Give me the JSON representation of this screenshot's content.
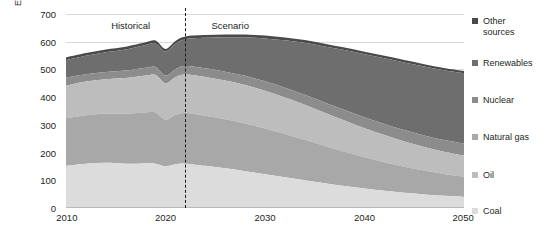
{
  "chart_data": {
    "type": "area",
    "stacked": true,
    "title": "",
    "subtitle": "",
    "xlabel": "",
    "ylabel": "EJ",
    "unit": "EJ",
    "grid": true,
    "legend_position": "right",
    "xlim": [
      2010,
      2050
    ],
    "ylim": [
      0,
      700
    ],
    "ytick_labels": [
      "0",
      "100",
      "200",
      "300",
      "400",
      "500",
      "600",
      "700"
    ],
    "yticks": [
      0,
      100,
      200,
      300,
      400,
      500,
      600,
      700
    ],
    "xtick_labels": [
      "2010",
      "2020",
      "2030",
      "2040",
      "2050"
    ],
    "xticks": [
      2010,
      2020,
      2030,
      2040,
      2050
    ],
    "x": [
      2010,
      2012,
      2014,
      2016,
      2018,
      2019,
      2020,
      2021,
      2022,
      2024,
      2026,
      2028,
      2030,
      2032,
      2034,
      2036,
      2038,
      2040,
      2042,
      2044,
      2046,
      2048,
      2050
    ],
    "series": [
      {
        "name": "Coal",
        "color": "#dcdcdc",
        "values": [
          152,
          160,
          163,
          160,
          161,
          160,
          151,
          158,
          160,
          152,
          143,
          133,
          122,
          111,
          100,
          89,
          79,
          70,
          62,
          55,
          49,
          44,
          40
        ]
      },
      {
        "name": "Oil",
        "color": "#a8a8a8",
        "values": [
          172,
          175,
          178,
          181,
          184,
          185,
          168,
          178,
          183,
          181,
          177,
          172,
          165,
          156,
          146,
          135,
          124,
          113,
          103,
          94,
          86,
          79,
          73
        ]
      },
      {
        "name": "Natural gas",
        "color": "#bdbdbd",
        "values": [
          117,
          121,
          124,
          128,
          133,
          135,
          131,
          136,
          139,
          140,
          140,
          139,
          136,
          132,
          127,
          120,
          113,
          105,
          98,
          91,
          85,
          80,
          76
        ]
      },
      {
        "name": "Nuclear",
        "color": "#8c8c8c",
        "values": [
          30,
          27,
          26,
          27,
          28,
          29,
          28,
          29,
          30,
          31,
          32,
          33,
          34,
          35,
          36,
          37,
          38,
          39,
          40,
          41,
          42,
          42,
          43
        ]
      },
      {
        "name": "Renewables",
        "color": "#6e6e6e",
        "values": [
          62,
          66,
          71,
          76,
          82,
          85,
          87,
          92,
          97,
          110,
          124,
          139,
          155,
          171,
          187,
          202,
          216,
          228,
          237,
          244,
          249,
          252,
          254
        ]
      },
      {
        "name": "Other sources",
        "color": "#4a4a4a",
        "values": [
          10,
          10,
          10,
          10,
          10,
          10,
          9,
          10,
          10,
          10,
          10,
          10,
          10,
          10,
          10,
          10,
          9,
          9,
          9,
          9,
          8,
          8,
          8
        ]
      }
    ],
    "annotations": [
      {
        "name": "historical",
        "text": "Historical",
        "x": 2016.5,
        "y": 660
      },
      {
        "name": "scenario",
        "text": "Scenario",
        "x": 2026.5,
        "y": 660
      },
      {
        "name": "phase-divider",
        "text": "",
        "x": 2022,
        "type": "dashed-vline"
      }
    ]
  },
  "legend": {
    "items": [
      {
        "label": "Other\nsources",
        "color": "#4a4a4a",
        "name": "other-sources"
      },
      {
        "label": "Renewables",
        "color": "#6e6e6e",
        "name": "renewables"
      },
      {
        "label": "Nuclear",
        "color": "#8c8c8c",
        "name": "nuclear"
      },
      {
        "label": "Natural gas",
        "color": "#a9a9a9",
        "name": "natural-gas"
      },
      {
        "label": "Oil",
        "color": "#bdbdbd",
        "name": "oil"
      },
      {
        "label": "Coal",
        "color": "#dcdcdc",
        "name": "coal"
      }
    ]
  },
  "annotations": {
    "historical": "Historical",
    "scenario": "Scenario"
  },
  "axis": {
    "unit": "EJ"
  }
}
